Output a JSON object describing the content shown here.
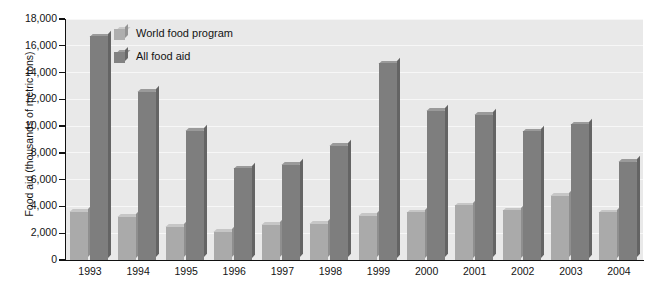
{
  "chart_data": {
    "type": "bar",
    "title": "",
    "xlabel": "",
    "ylabel": "Food aid (thousands of metric tons)",
    "categories": [
      "1993",
      "1994",
      "1995",
      "1996",
      "1997",
      "1998",
      "1999",
      "2000",
      "2001",
      "2002",
      "2003",
      "2004"
    ],
    "series": [
      {
        "name": "World food program",
        "color": "#aaaaaa",
        "values": [
          3600,
          3250,
          2500,
          2100,
          2650,
          2700,
          3300,
          3550,
          4100,
          3700,
          4800,
          3550
        ]
      },
      {
        "name": "All food aid",
        "color": "#7e7e7e",
        "values": [
          16700,
          12550,
          9650,
          6850,
          7100,
          8550,
          14700,
          11150,
          10850,
          9600,
          10150,
          7350
        ]
      }
    ],
    "ylim": [
      0,
      18000
    ],
    "ytick_step": 2000,
    "ytick_labels": [
      "0",
      "2,000",
      "4,000",
      "6,000",
      "8,000",
      "10,000",
      "12,000",
      "14,000",
      "16,000",
      "18,000"
    ],
    "grid": true,
    "legend_position": "top-left-inside",
    "plot_background": "#e9e9e9"
  }
}
